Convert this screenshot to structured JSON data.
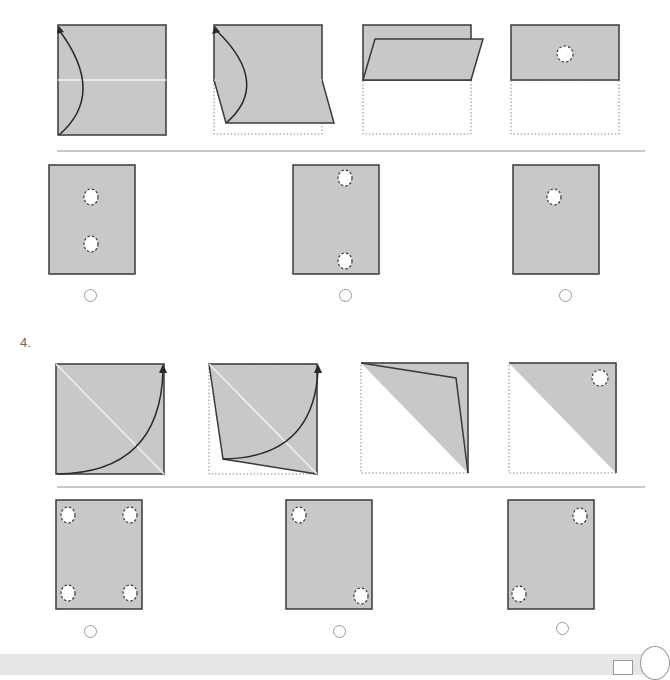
{
  "colors": {
    "paper": "#c8c8c8",
    "outline": "#3a3a3a",
    "fold_line": "#f2f2f2",
    "divider": "#c8c8c8",
    "radio_border": "#9a9a9a",
    "footer": "#e6e6e6"
  },
  "question3": {
    "steps": [
      {
        "description": "square with horizontal center fold line, curved arrow from bottom-left to top-left"
      },
      {
        "description": "bottom half folding upward, dotted outline of original bottom half"
      },
      {
        "description": "bottom half folded onto top half (parallelogram flap)"
      },
      {
        "description": "folded rectangle with one punched hole at center"
      }
    ],
    "options": [
      {
        "id": "q3-option-1",
        "holes": "two holes, vertical center, upper and lower middle"
      },
      {
        "id": "q3-option-2",
        "holes": "two holes, vertical center, top edge and bottom edge"
      },
      {
        "id": "q3-option-3",
        "holes": "one hole, upper center"
      }
    ]
  },
  "question4": {
    "number_label": "4.",
    "steps": [
      {
        "description": "square with diagonal fold line top-left to bottom-right, curved arrow from bottom to top-right"
      },
      {
        "description": "bottom-left triangle folding toward top-right"
      },
      {
        "description": "folded triangle flap"
      },
      {
        "description": "upper-right triangle with one punched hole near top-right corner"
      }
    ],
    "options": [
      {
        "id": "q4-option-1",
        "holes": "four holes, all corners"
      },
      {
        "id": "q4-option-2",
        "holes": "two holes, top-left and bottom-right"
      },
      {
        "id": "q4-option-3",
        "holes": "two holes, top-right and bottom-left"
      }
    ]
  }
}
